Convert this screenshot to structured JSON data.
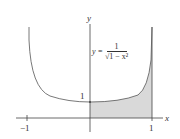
{
  "diagram": {
    "equation_lhs": "y =",
    "equation_num": "1",
    "equation_den": "√1 − x²",
    "axis_x_label": "x",
    "axis_y_label": "y",
    "tick_neg1": "−1",
    "tick_pos1": "1",
    "y_intercept_label": "1",
    "shaded_region": "area under curve from x=0 to x=1",
    "colors": {
      "curve": "#555555",
      "shade": "#d9d9d9",
      "axis": "#444444"
    }
  }
}
